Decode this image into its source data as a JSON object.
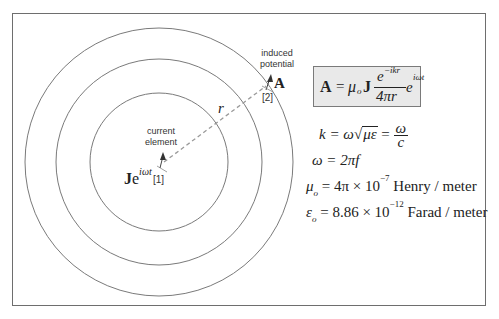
{
  "diagram": {
    "source": {
      "label_line1": "current",
      "label_line2": "element",
      "symbol_base": "J",
      "symbol_exp_e": "e",
      "symbol_exponent": "iωt",
      "index": "[1]"
    },
    "observer": {
      "label_line1": "induced",
      "label_line2": "potential",
      "symbol": "A",
      "index": "[2]"
    },
    "distance_label": "r",
    "wavefronts": {
      "count": 3,
      "center": [
        159,
        162
      ],
      "radii": [
        69,
        103,
        134
      ],
      "stroke_color": "#7a7a7a"
    },
    "colors": {
      "frame_border": "#6e6e6e",
      "formula_box_fill": "#e9e9e9",
      "dashed_line": "#9a9a9a",
      "text": "#222222"
    }
  },
  "formulas": {
    "main": {
      "lhs": "A",
      "equals": "=",
      "mu": "μ",
      "mu_sub": "o",
      "J": "J",
      "numerator": "e",
      "numerator_exp": "−ikr",
      "denominator": "4πr",
      "tail": "e",
      "tail_exp": "iωt"
    },
    "k_line": {
      "lhs": "k",
      "eq1": " = ω",
      "sqrt": "με",
      "eq2": " = ",
      "frac_num": "ω",
      "frac_den": "c"
    },
    "omega_line": {
      "text": "ω = 2πf"
    },
    "mu_line": {
      "sym": "μ",
      "sub": "o",
      "mid": " = 4π × 10",
      "exp": "−7",
      "unit": " Henry / meter"
    },
    "eps_line": {
      "sym": "ε",
      "sub": "o",
      "mid": " = 8.86 × 10",
      "exp": "−12",
      "unit": " Farad / meter"
    }
  }
}
